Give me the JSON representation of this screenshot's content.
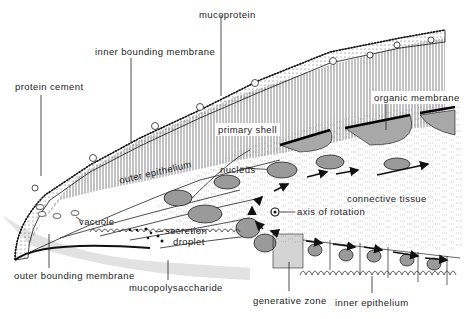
{
  "diagram": {
    "type": "biological cross-section (shell mantle edge)",
    "labels": {
      "mucoprotein": "mucoprotein",
      "inner_bounding_membrane": "inner bounding membrane",
      "protein_cement": "protein cement",
      "organic_membrane": "organic membrane",
      "primary_shell": "primary shell",
      "outer_epithelium": "outer epithelium",
      "nucleus": "nucleus",
      "connective_tissue": "connective tissue",
      "axis_of_rotation": "axis of rotation",
      "vacuole": "vacuole",
      "secretion": "secretion",
      "droplet": "droplet",
      "outer_bounding_membrane": "outer bounding membrane",
      "mucopolysaccharide": "mucopolysaccharide",
      "generative_zone": "generative zone",
      "inner_epithelium": "inner epithelium"
    },
    "colors": {
      "ink": "#222222",
      "nucleus_fill": "#9a9a9a",
      "organic_membrane_fill": "#a8a8a8",
      "shadow": "#e2e2e2"
    }
  }
}
